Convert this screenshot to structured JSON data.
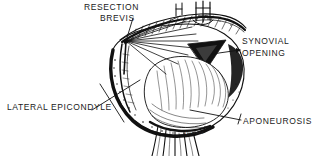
{
  "figure": {
    "background_color": "#ffffff",
    "ink_color": "#111111",
    "labels": {
      "resection": "RESECTION",
      "brevis": "BREVIS",
      "synovial": "SYNOVIAL",
      "opening": "OPENING",
      "lateral_epicondyle": "LATERAL EPICONDYLE",
      "aponeurosis": "APONEUROSIS"
    },
    "signature": "Howard"
  }
}
